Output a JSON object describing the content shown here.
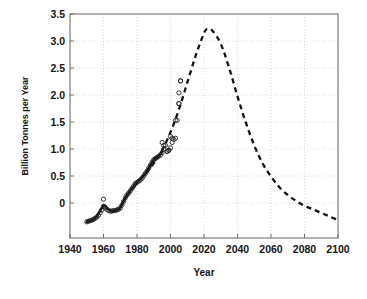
{
  "chart_data": {
    "type": "line",
    "title": "",
    "xlabel": "Year",
    "ylabel": "Billion Tonnes per Year",
    "xlim": [
      1940,
      2100
    ],
    "ylim": [
      -0.25,
      3.5
    ],
    "grid": true,
    "legend": "none",
    "xticks": [
      1940,
      1960,
      1980,
      2000,
      2020,
      2040,
      2060,
      2080,
      2100
    ],
    "xtick_labels": [
      "1940",
      "1960",
      "1980",
      "2000",
      "2020",
      "2040",
      "2060",
      "2080",
      "2100"
    ],
    "yticks": [
      0,
      0.5,
      1.0,
      1.5,
      2.0,
      2.5,
      3.0,
      3.5
    ],
    "ytick_labels": [
      "0",
      "0.5",
      "1.0",
      "1.5",
      "2.0",
      "2.5",
      "3.0",
      "3.5"
    ],
    "series": [
      {
        "name": "Historical data",
        "style": "scatter",
        "marker": "open-circle",
        "color": "#222222",
        "x": [
          1950,
          1951,
          1952,
          1953,
          1954,
          1955,
          1956,
          1957,
          1958,
          1959,
          1960,
          1961,
          1962,
          1963,
          1964,
          1965,
          1966,
          1967,
          1968,
          1969,
          1970,
          1971,
          1972,
          1973,
          1974,
          1975,
          1976,
          1977,
          1978,
          1979,
          1980,
          1981,
          1982,
          1983,
          1984,
          1985,
          1986,
          1987,
          1988,
          1989,
          1990,
          1991,
          1992,
          1993,
          1994,
          1995,
          1996,
          1997,
          1998,
          1999,
          2000,
          2001,
          2002,
          2003,
          2004,
          2005,
          2006
        ],
        "y": [
          0.02,
          0.03,
          0.04,
          0.05,
          0.06,
          0.08,
          0.1,
          0.13,
          0.17,
          0.22,
          0.28,
          0.26,
          0.23,
          0.21,
          0.2,
          0.2,
          0.21,
          0.21,
          0.22,
          0.23,
          0.25,
          0.3,
          0.36,
          0.42,
          0.47,
          0.5,
          0.54,
          0.58,
          0.62,
          0.66,
          0.68,
          0.7,
          0.72,
          0.75,
          0.79,
          0.83,
          0.87,
          0.92,
          0.97,
          1.02,
          1.06,
          1.08,
          1.1,
          1.12,
          1.14,
          1.18,
          1.24,
          1.3,
          1.2,
          1.22,
          1.26,
          1.35,
          1.4,
          1.42,
          1.72,
          2.0,
          2.38
        ],
        "outliers": [
          {
            "x": 1960,
            "y": 0.4
          },
          {
            "x": 1995,
            "y": 1.35
          },
          {
            "x": 1996,
            "y": 1.3
          },
          {
            "x": 1998,
            "y": 1.2
          },
          {
            "x": 1999,
            "y": 1.22
          },
          {
            "x": 2000,
            "y": 1.45
          },
          {
            "x": 2001,
            "y": 1.42
          },
          {
            "x": 2003,
            "y": 1.72
          },
          {
            "x": 2005,
            "y": 2.0
          },
          {
            "x": 2005,
            "y": 2.18
          },
          {
            "x": 2006,
            "y": 2.38
          }
        ]
      },
      {
        "name": "Smoothed historical trend",
        "style": "solid-line",
        "color": "#111111",
        "x": [
          1950,
          1955,
          1960,
          1962,
          1965,
          1968,
          1970,
          1973,
          1976,
          1980,
          1985,
          1990,
          1993,
          1995
        ],
        "y": [
          0.02,
          0.08,
          0.29,
          0.25,
          0.2,
          0.22,
          0.26,
          0.42,
          0.54,
          0.68,
          0.83,
          1.06,
          1.12,
          1.2
        ]
      },
      {
        "name": "Projection (Hubbert curve)",
        "style": "dashed-line",
        "color": "#111111",
        "x": [
          1978,
          1985,
          1990,
          1995,
          2000,
          2005,
          2010,
          2015,
          2020,
          2022,
          2025,
          2030,
          2035,
          2040,
          2045,
          2050,
          2055,
          2060,
          2065,
          2070,
          2075,
          2080,
          2085,
          2090,
          2095,
          2100
        ],
        "y": [
          0.62,
          0.83,
          1.0,
          1.22,
          1.52,
          1.9,
          2.35,
          2.8,
          3.18,
          3.25,
          3.22,
          3.0,
          2.6,
          2.12,
          1.68,
          1.3,
          1.0,
          0.78,
          0.6,
          0.47,
          0.37,
          0.29,
          0.23,
          0.17,
          0.11,
          0.05
        ],
        "peak": {
          "x": 2022,
          "y": 3.25
        }
      }
    ],
    "annotations": []
  },
  "axes": {
    "x_title": "Year",
    "y_title": "Billion Tonnes per Year"
  }
}
